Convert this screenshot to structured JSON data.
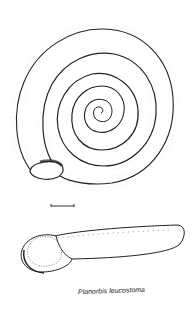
{
  "figure": {
    "views": [
      "apical-view",
      "apertural-side-view"
    ],
    "scale_bar": true
  },
  "caption": {
    "text": "Planorbis leucostoma"
  },
  "colors": {
    "ink": "#222222",
    "background": "#ffffff"
  }
}
